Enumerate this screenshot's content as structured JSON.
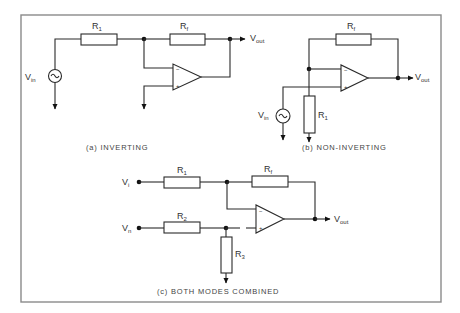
{
  "figure": {
    "frame_color": "#8a8a8a",
    "line_color": "#2a2a2a"
  },
  "circuit_a": {
    "caption": "(a) INVERTING",
    "input_label": "V",
    "input_sub": "in",
    "output_label": "V",
    "output_sub": "out",
    "r1_label": "R",
    "r1_sub": "1",
    "rf_label": "R",
    "rf_sub": "f",
    "opamp_minus": "−",
    "opamp_plus": "+"
  },
  "circuit_b": {
    "caption": "(b) NON-INVERTING",
    "input_label": "V",
    "input_sub": "in",
    "output_label": "V",
    "output_sub": "out",
    "r1_label": "R",
    "r1_sub": "1",
    "rf_label": "R",
    "rf_sub": "f",
    "opamp_minus": "−",
    "opamp_plus": "+"
  },
  "circuit_c": {
    "caption": "(c) BOTH MODES COMBINED",
    "input1_label": "V",
    "input1_sub": "i",
    "input2_label": "V",
    "input2_sub": "n",
    "output_label": "V",
    "output_sub": "out",
    "r1_label": "R",
    "r1_sub": "1",
    "r2_label": "R",
    "r2_sub": "2",
    "r3_label": "R",
    "r3_sub": "3",
    "rf_label": "R",
    "rf_sub": "f",
    "opamp_minus": "−",
    "opamp_plus": "+"
  }
}
